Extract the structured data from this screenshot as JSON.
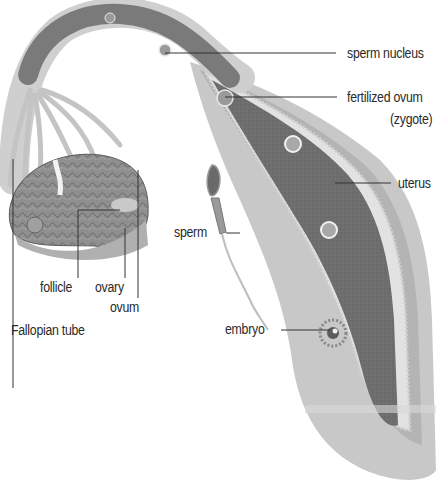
{
  "diagram": {
    "colors": {
      "background": "#ffffff",
      "uterine_wall_outer": "#c9c9c9",
      "uterine_wall_mid": "#b3b3b3",
      "lumen": "#6f6f6f",
      "lining_fringe": "#e0e0e0",
      "ovary": "#8a8a8a",
      "leader_line": "#333333",
      "text": "#2a2a2a"
    },
    "labels": {
      "sperm_nucleus": "sperm nucleus",
      "fertilized_ovum": "fertilized ovum",
      "zygote": "(zygote)",
      "uterus": "uterus",
      "sperm": "sperm",
      "embryo": "embryo",
      "follicle": "follicle",
      "ovary": "ovary",
      "ovum": "ovum",
      "fallopian_tube": "Fallopian tube"
    }
  }
}
